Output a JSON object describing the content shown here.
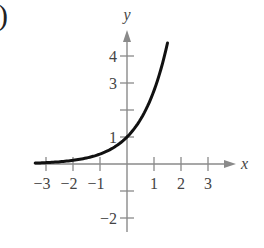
{
  "figure": {
    "panel_marker": ")"
  },
  "chart_data": {
    "type": "line",
    "title": "",
    "xlabel": "x",
    "ylabel": "y",
    "xlim": [
      -3.5,
      3.8
    ],
    "ylim": [
      -2.5,
      4.9
    ],
    "x_ticks": [
      -3,
      -2,
      -1,
      1,
      2,
      3
    ],
    "x_tick_labels": [
      "−3",
      "−2",
      "−1",
      "1",
      "2",
      "3"
    ],
    "y_ticks": [
      -2,
      -1,
      1,
      2,
      3,
      4
    ],
    "y_tick_labels": [
      "−2",
      "",
      "1",
      "",
      "3",
      "4"
    ],
    "grid": false,
    "legend": null,
    "series": [
      {
        "name": "y = e^x",
        "function": "exp(x)",
        "x": [
          -3.4,
          -3,
          -2.5,
          -2,
          -1.5,
          -1,
          -0.5,
          0,
          0.5,
          1,
          1.25,
          1.5
        ],
        "values": [
          0.033,
          0.05,
          0.082,
          0.135,
          0.223,
          0.368,
          0.607,
          1.0,
          1.649,
          2.718,
          3.49,
          4.48
        ]
      }
    ],
    "colors": {
      "axis": "#8a8a8a",
      "curve": "#111111",
      "text": "#444444"
    }
  }
}
